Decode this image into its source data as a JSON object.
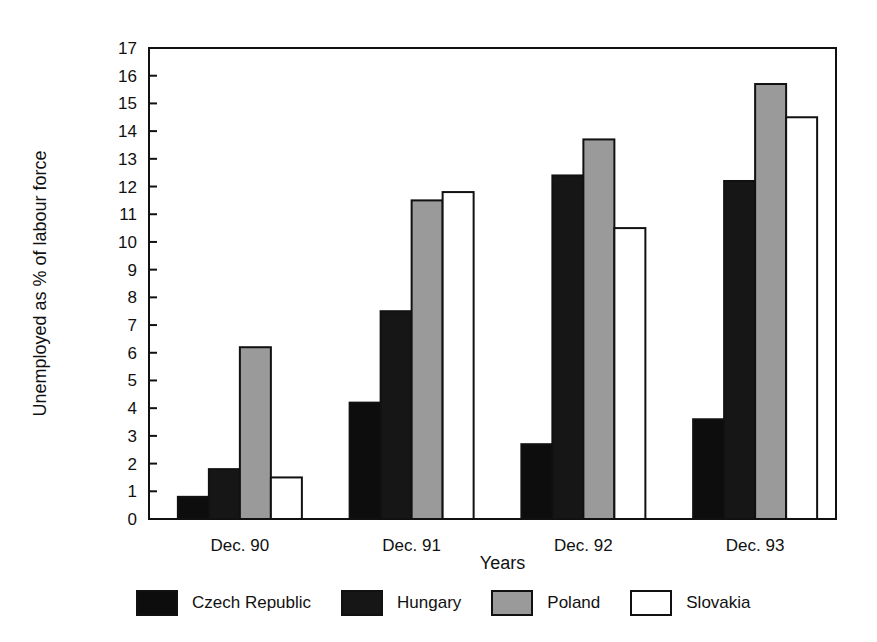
{
  "chart_data": {
    "type": "bar",
    "title": "",
    "xlabel": "Years",
    "ylabel": "Unemployed as % of labour force",
    "ylim": [
      0,
      17
    ],
    "yticks": [
      0,
      1,
      2,
      3,
      4,
      5,
      6,
      7,
      8,
      9,
      10,
      11,
      12,
      13,
      14,
      15,
      16,
      17
    ],
    "grid": false,
    "legend_position": "bottom",
    "categories": [
      "Dec. 90",
      "Dec. 91",
      "Dec. 92",
      "Dec. 93"
    ],
    "series": [
      {
        "name": "Czech Republic",
        "color": "#0d0d0d",
        "values": [
          0.8,
          4.2,
          2.7,
          3.6
        ]
      },
      {
        "name": "Hungary",
        "color": "#161616",
        "values": [
          1.8,
          7.5,
          12.4,
          12.2
        ]
      },
      {
        "name": "Poland",
        "color": "#9a9a9a",
        "values": [
          6.2,
          11.5,
          13.7,
          15.7
        ]
      },
      {
        "name": "Slovakia",
        "color": "#ffffff",
        "values": [
          1.5,
          11.8,
          10.5,
          14.5
        ]
      }
    ]
  },
  "legend": [
    {
      "label": "Czech Republic",
      "color": "#0d0d0d"
    },
    {
      "label": "Hungary",
      "color": "#161616"
    },
    {
      "label": "Poland",
      "color": "#9a9a9a"
    },
    {
      "label": "Slovakia",
      "color": "#ffffff"
    }
  ]
}
